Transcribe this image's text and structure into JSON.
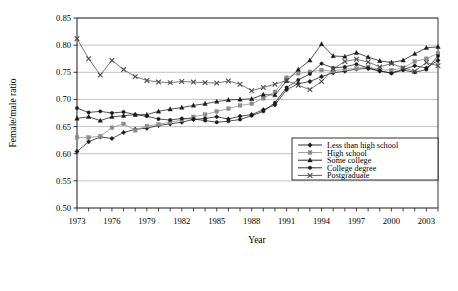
{
  "chart_data": {
    "type": "line",
    "title": "",
    "xlabel": "Year",
    "ylabel": "Female/male ratio",
    "xlim": [
      1973,
      2004
    ],
    "ylim": [
      0.5,
      0.85
    ],
    "yticks": [
      0.5,
      0.55,
      0.6,
      0.65,
      0.7,
      0.75,
      0.8,
      0.85
    ],
    "ytick_labels": [
      "0.50",
      "0.55",
      "0.60",
      "0.65",
      "0.70",
      "0.75",
      "0.80",
      "0.85"
    ],
    "xticks": [
      1973,
      1976,
      1979,
      1982,
      1985,
      1988,
      1991,
      1994,
      1997,
      2000,
      2003
    ],
    "xtick_labels": [
      "1973",
      "1976",
      "1979",
      "1982",
      "1985",
      "1988",
      "1991",
      "1994",
      "1997",
      "2000",
      "2003"
    ],
    "grid": "horizontal",
    "legend_position": "inside-lower-right",
    "x": [
      1973,
      1974,
      1975,
      1976,
      1977,
      1978,
      1979,
      1980,
      1981,
      1982,
      1983,
      1984,
      1985,
      1986,
      1987,
      1988,
      1989,
      1990,
      1991,
      1992,
      1993,
      1994,
      1995,
      1996,
      1997,
      1998,
      1999,
      2000,
      2001,
      2002,
      2003,
      2004
    ],
    "series": [
      {
        "name": "Less than high school",
        "marker": "diamond",
        "color": "#1a1a1a",
        "values": [
          0.604,
          0.622,
          0.631,
          0.628,
          0.639,
          0.645,
          0.647,
          0.652,
          0.655,
          0.658,
          0.663,
          0.665,
          0.668,
          0.664,
          0.669,
          0.672,
          0.681,
          0.69,
          0.718,
          0.729,
          0.733,
          0.742,
          0.749,
          0.752,
          0.756,
          0.757,
          0.752,
          0.749,
          0.755,
          0.762,
          0.758,
          0.772
        ]
      },
      {
        "name": "High school",
        "marker": "square",
        "color": "#8c8c8c",
        "values": [
          0.63,
          0.63,
          0.632,
          0.648,
          0.655,
          0.643,
          0.651,
          0.654,
          0.658,
          0.662,
          0.668,
          0.672,
          0.678,
          0.683,
          0.689,
          0.692,
          0.702,
          0.714,
          0.74,
          0.748,
          0.751,
          0.754,
          0.752,
          0.756,
          0.757,
          0.76,
          0.755,
          0.754,
          0.758,
          0.77,
          0.775,
          0.785
        ]
      },
      {
        "name": "Some college",
        "marker": "triangle",
        "color": "#1a1a1a",
        "values": [
          0.665,
          0.668,
          0.661,
          0.668,
          0.67,
          0.672,
          0.672,
          0.678,
          0.682,
          0.685,
          0.689,
          0.692,
          0.696,
          0.699,
          0.7,
          0.701,
          0.709,
          0.708,
          0.734,
          0.755,
          0.772,
          0.802,
          0.78,
          0.779,
          0.786,
          0.778,
          0.771,
          0.768,
          0.772,
          0.784,
          0.795,
          0.797
        ]
      },
      {
        "name": "College degree",
        "marker": "circle",
        "color": "#1a1a1a",
        "values": [
          0.684,
          0.676,
          0.678,
          0.675,
          0.677,
          0.672,
          0.669,
          0.664,
          0.662,
          0.665,
          0.664,
          0.661,
          0.658,
          0.66,
          0.663,
          0.67,
          0.678,
          0.694,
          0.722,
          0.736,
          0.747,
          0.766,
          0.758,
          0.76,
          0.765,
          0.758,
          0.753,
          0.748,
          0.754,
          0.75,
          0.755,
          0.78
        ]
      },
      {
        "name": "Postgraduate",
        "marker": "cross",
        "color": "#4d4d4d",
        "values": [
          0.812,
          0.775,
          0.745,
          0.772,
          0.755,
          0.742,
          0.735,
          0.732,
          0.731,
          0.733,
          0.732,
          0.731,
          0.73,
          0.734,
          0.728,
          0.716,
          0.722,
          0.728,
          0.735,
          0.726,
          0.718,
          0.733,
          0.756,
          0.77,
          0.774,
          0.769,
          0.76,
          0.766,
          0.758,
          0.752,
          0.768,
          0.762
        ]
      }
    ]
  },
  "legend": {
    "items": [
      {
        "label": "Less than high school"
      },
      {
        "label": "High school"
      },
      {
        "label": "Some college"
      },
      {
        "label": "College degree"
      },
      {
        "label": "Postgraduate"
      }
    ]
  }
}
